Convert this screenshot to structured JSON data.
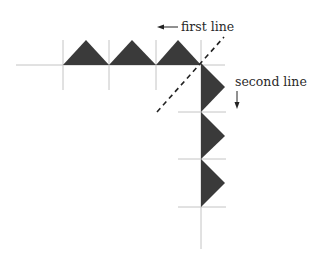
{
  "diagram": {
    "labels": {
      "first_line": "first line",
      "second_line": "second line"
    },
    "first_line": {
      "direction": "left",
      "triangle_count": 3,
      "triangle_orientation": "pointing up"
    },
    "second_line": {
      "direction": "down",
      "triangle_count": 3,
      "triangle_orientation": "pointing right"
    },
    "fold_line": "diagonal dashed line at corner",
    "colors": {
      "triangle_fill": "#3a3a3a",
      "grid_line": "#c4c4c4",
      "ink": "#222222"
    }
  }
}
